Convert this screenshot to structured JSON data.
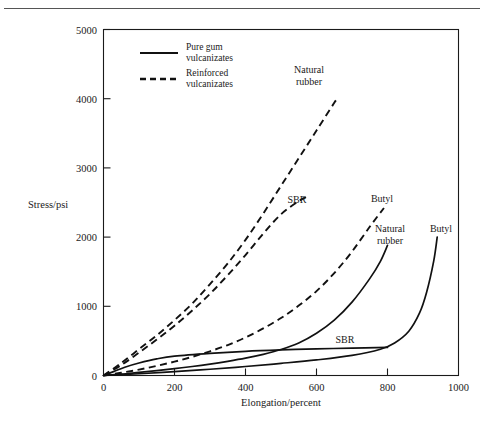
{
  "figure": {
    "name": "stress-elongation-chart",
    "background_color": "#ffffff",
    "ink_color": "#111111"
  },
  "chart_data": {
    "type": "line",
    "title": "",
    "xlabel": "Elongation/percent",
    "ylabel": "Stress/psi",
    "xlim": [
      0,
      1000
    ],
    "ylim": [
      0,
      5000
    ],
    "xticks": [
      0,
      200,
      400,
      600,
      800,
      1000
    ],
    "yticks": [
      0,
      1000,
      2000,
      3000,
      4000,
      5000
    ],
    "xtick_labels": [
      "0",
      "200",
      "400",
      "600",
      "800",
      "1000"
    ],
    "ytick_labels": [
      "0",
      "1000",
      "2000",
      "3000",
      "4000",
      "5000"
    ],
    "grid": false,
    "legend_position": "top-left-inside",
    "legend_entries": [
      {
        "style": "solid",
        "label_line1": "Pure gum",
        "label_line2": "vulcanizates"
      },
      {
        "style": "dashed",
        "label_line1": "Reinforced",
        "label_line2": "vulcanizates"
      }
    ],
    "series": [
      {
        "name": "Natural rubber (reinforced)",
        "label": "Natural rubber",
        "label_line1": "Natural",
        "label_line2": "rubber",
        "style": "dashed",
        "x": [
          0,
          50,
          100,
          150,
          200,
          250,
          300,
          350,
          400,
          450,
          500,
          550,
          600,
          650,
          660
        ],
        "y": [
          0,
          180,
          380,
          580,
          800,
          1040,
          1320,
          1620,
          1960,
          2340,
          2740,
          3140,
          3540,
          3940,
          4010
        ]
      },
      {
        "name": "SBR (reinforced)",
        "label": "SBR",
        "style": "dashed",
        "x": [
          0,
          50,
          100,
          150,
          200,
          250,
          300,
          350,
          400,
          450,
          500,
          550,
          580
        ],
        "y": [
          0,
          150,
          330,
          520,
          720,
          940,
          1180,
          1450,
          1740,
          2050,
          2330,
          2520,
          2600
        ]
      },
      {
        "name": "Butyl (reinforced)",
        "label": "Butyl",
        "style": "dashed",
        "x": [
          0,
          50,
          100,
          150,
          200,
          250,
          300,
          350,
          400,
          450,
          500,
          550,
          600,
          650,
          700,
          750,
          790
        ],
        "y": [
          0,
          40,
          85,
          140,
          200,
          270,
          350,
          440,
          550,
          680,
          830,
          1010,
          1220,
          1480,
          1790,
          2150,
          2420
        ]
      },
      {
        "name": "Natural rubber (pure gum)",
        "label": "Natural rubber",
        "label_line1": "Natural",
        "label_line2": "rubber",
        "style": "solid",
        "x": [
          0,
          50,
          100,
          150,
          200,
          250,
          300,
          350,
          400,
          450,
          500,
          550,
          600,
          650,
          700,
          750,
          780,
          800
        ],
        "y": [
          0,
          20,
          45,
          70,
          100,
          130,
          165,
          205,
          250,
          305,
          375,
          470,
          610,
          800,
          1060,
          1400,
          1650,
          1880
        ]
      },
      {
        "name": "SBR (pure gum)",
        "label": "SBR",
        "style": "solid",
        "x": [
          0,
          30,
          60,
          100,
          150,
          200,
          300,
          400,
          500,
          600,
          700,
          800
        ],
        "y": [
          0,
          60,
          120,
          180,
          240,
          280,
          320,
          350,
          370,
          385,
          395,
          405
        ]
      },
      {
        "name": "Butyl (pure gum)",
        "label": "Butyl",
        "style": "solid",
        "x": [
          0,
          100,
          200,
          300,
          400,
          500,
          600,
          700,
          780,
          820,
          860,
          890,
          910,
          930,
          940
        ],
        "y": [
          0,
          25,
          55,
          90,
          130,
          175,
          225,
          290,
          380,
          470,
          640,
          900,
          1200,
          1650,
          2000
        ]
      }
    ],
    "curve_annotations": [
      {
        "text": "Natural rubber",
        "series": "Natural rubber (reinforced)"
      },
      {
        "text": "SBR",
        "series": "SBR (reinforced)"
      },
      {
        "text": "Butyl",
        "series": "Butyl (reinforced)"
      },
      {
        "text": "Natural rubber",
        "series": "Natural rubber (pure gum)"
      },
      {
        "text": "SBR",
        "series": "SBR (pure gum)"
      },
      {
        "text": "Butyl",
        "series": "Butyl (pure gum)"
      }
    ]
  },
  "labels": {
    "y_axis_title": "Stress/psi",
    "x_axis_title": "Elongation/percent",
    "xtick_0": "0",
    "xtick_1": "200",
    "xtick_2": "400",
    "xtick_3": "600",
    "xtick_4": "800",
    "xtick_5": "1000",
    "ytick_0": "0",
    "ytick_1": "1000",
    "ytick_2": "2000",
    "ytick_3": "3000",
    "ytick_4": "4000",
    "ytick_5": "5000",
    "legend_solid_l1": "Pure gum",
    "legend_solid_l2": "vulcanizates",
    "legend_dashed_l1": "Reinforced",
    "legend_dashed_l2": "vulcanizates",
    "ann_nr_reinf_l1": "Natural",
    "ann_nr_reinf_l2": "rubber",
    "ann_sbr_reinf": "SBR",
    "ann_butyl_reinf": "Butyl",
    "ann_nr_gum_l1": "Natural",
    "ann_nr_gum_l2": "rubber",
    "ann_sbr_gum": "SBR",
    "ann_butyl_gum": "Butyl"
  }
}
